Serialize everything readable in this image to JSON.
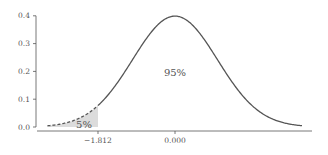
{
  "chart_data": {
    "type": "area",
    "title": "",
    "xlabel": "",
    "ylabel": "",
    "distribution": "standard normal pdf",
    "xlim": [
      -3.0,
      3.0
    ],
    "ylim": [
      0.0,
      0.4
    ],
    "grid": false,
    "legend": null,
    "yticks": [
      0.0,
      0.1,
      0.2,
      0.3,
      0.4
    ],
    "ytick_labels": [
      "0.0",
      "0.1",
      "0.2",
      "0.3",
      "0.4"
    ],
    "xticks": [
      -1.812,
      0.0
    ],
    "xtick_labels": [
      "−1.812",
      "0.000"
    ],
    "critical_value": -1.812,
    "peak": {
      "x": 0.0,
      "y": 0.399
    },
    "shaded_region": {
      "from": -3.0,
      "to": -1.812,
      "label": "5%",
      "line_style": "dashed",
      "fill": "#dcdcdc"
    },
    "annotations": [
      {
        "text": "95%",
        "x": 0.0,
        "y": 0.2
      },
      {
        "text": "5%",
        "x": -2.3,
        "y": 0.012
      }
    ],
    "colors": {
      "curve": "#555555",
      "fill": "#dcdcdc",
      "axis": "#555555"
    }
  },
  "labels": {
    "center": "95%",
    "tail": "5%"
  }
}
